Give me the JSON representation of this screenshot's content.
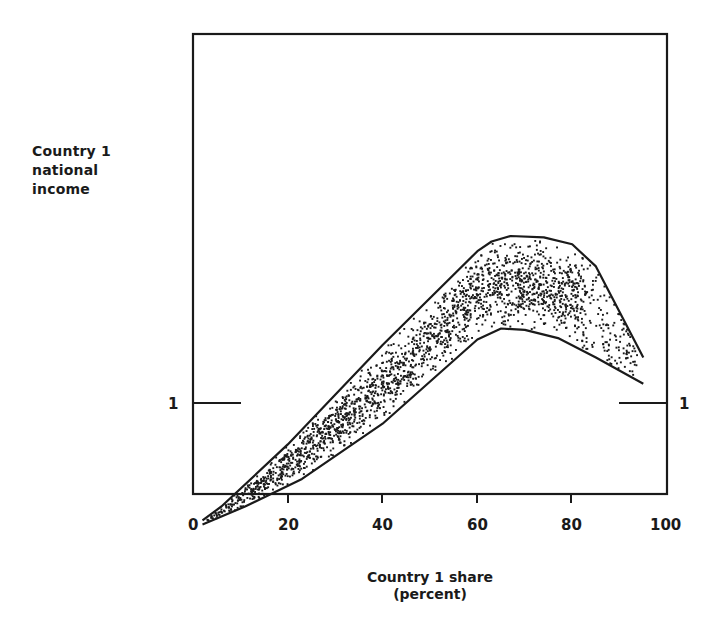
{
  "chart_data": {
    "type": "scatter",
    "title": "",
    "xlabel": "Country 1 share\n(percent)",
    "ylabel": "Country 1\nnational\nincome",
    "xlim": [
      0,
      100
    ],
    "x_ticks": [
      0,
      20,
      40,
      60,
      80,
      100
    ],
    "x_tick_labels": [
      "0",
      "20",
      "40",
      "60",
      "80",
      "100"
    ],
    "y_ticks": [
      1
    ],
    "y_tick_labels": [
      "1"
    ],
    "y_reference_line": {
      "value": 1,
      "left_segment_x": [
        0,
        10
      ],
      "right_segment_x": [
        90,
        100
      ]
    },
    "grid": false,
    "legend": null,
    "series": [
      {
        "name": "upper envelope",
        "style": "line",
        "x": [
          2,
          6,
          20,
          40,
          60,
          63,
          67,
          74,
          80,
          85,
          95
        ],
        "y": [
          0.15,
          0.25,
          0.7,
          1.42,
          2.1,
          2.17,
          2.21,
          2.2,
          2.15,
          1.99,
          1.33
        ]
      },
      {
        "name": "lower envelope",
        "style": "line",
        "x": [
          2,
          11,
          23,
          40,
          60,
          65,
          70,
          77,
          85,
          95
        ],
        "y": [
          0.12,
          0.25,
          0.45,
          0.85,
          1.46,
          1.54,
          1.53,
          1.47,
          1.33,
          1.14
        ]
      },
      {
        "name": "simulated outcomes",
        "style": "dots",
        "description": "dense random point cloud filling the band between envelopes; densest along band center from ~15% to ~82% share, sparse beyond 82%",
        "center_x": [
          5,
          20,
          40,
          60,
          70,
          80,
          90
        ],
        "center_y": [
          0.2,
          0.6,
          1.12,
          1.75,
          1.88,
          1.78,
          1.35
        ]
      }
    ]
  },
  "labels": {
    "ylabel": "Country 1\nnational\nincome",
    "xlabel": "Country 1 share\n(percent)",
    "y_one_left": "1",
    "y_one_right": "1",
    "x0": "0",
    "x20": "20",
    "x40": "40",
    "x60": "60",
    "x80": "80",
    "x100": "100"
  }
}
